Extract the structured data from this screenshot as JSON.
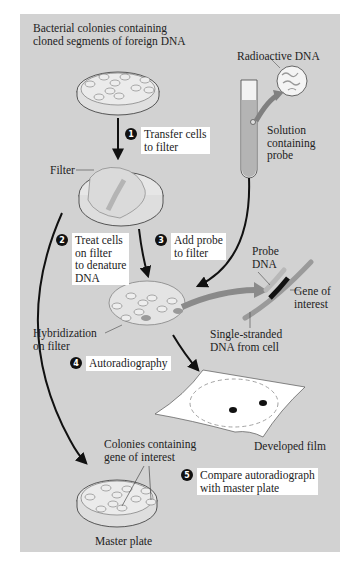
{
  "title": "Bacterial colonies containing\ncloned segments of foreign DNA",
  "labels": {
    "radioactive_dna": "Radioactive DNA",
    "solution": "Solution\ncontaining\nprobe",
    "filter": "Filter",
    "probe_dna": "Probe\nDNA",
    "gene_of_interest": "Gene of\ninterest",
    "single_stranded": "Single-stranded\nDNA from cell",
    "hybridization": "Hybridization\non filter",
    "developed_film": "Developed film",
    "colonies_gene": "Colonies containing\ngene of interest",
    "master_plate": "Master plate"
  },
  "steps": [
    {
      "num": "1",
      "text": "Transfer cells\nto filter"
    },
    {
      "num": "2",
      "text": "Treat cells\non filter\nto denature\nDNA"
    },
    {
      "num": "3",
      "text": "Add probe\nto filter"
    },
    {
      "num": "4",
      "text": "Autoradiography"
    },
    {
      "num": "5",
      "text": "Compare autoradiograph\nwith master plate"
    }
  ],
  "colors": {
    "panel": "#d2d2d2",
    "plate_fill": "#e6e6e6",
    "probe_strand": "#8e8e8e",
    "gene_band": "#111111",
    "arrow": "#111111",
    "gray_arrow": "#808080"
  }
}
